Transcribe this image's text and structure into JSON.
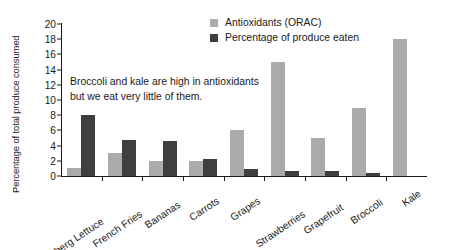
{
  "chart_data": {
    "type": "bar",
    "title": "",
    "xlabel": "",
    "ylabel": "Percentage of total produce consumed",
    "ylim": [
      0,
      20
    ],
    "yticks": [
      0,
      2,
      4,
      6,
      8,
      10,
      12,
      14,
      16,
      18,
      20
    ],
    "grid": false,
    "legend_position": "top-right",
    "categories": [
      "Iceberg Lettuce",
      "French Fries",
      "Bananas",
      "Carrots",
      "Grapes",
      "Strawberries",
      "Grapefruit",
      "Broccoli",
      "Kale"
    ],
    "series": [
      {
        "name": "Antioxidants (ORAC)",
        "color": "#ababab",
        "values": [
          1,
          3,
          2,
          2,
          6,
          15,
          5,
          9,
          18
        ]
      },
      {
        "name": "Percentage of produce eaten",
        "color": "#3f3f3f",
        "values": [
          8,
          4.7,
          4.6,
          2.3,
          0.9,
          0.7,
          0.6,
          0.35,
          0
        ]
      }
    ],
    "annotations": [
      {
        "line1": "Broccoli and kale are high in antioxidants",
        "line2": "but we eat very little of them."
      }
    ]
  },
  "legend": {
    "items": [
      {
        "label": "Antioxidants (ORAC)"
      },
      {
        "label": "Percentage of produce eaten"
      }
    ]
  },
  "annotation": {
    "line1": "Broccoli and kale are high in antioxidants",
    "line2": "but we eat very little of them."
  },
  "axes": {
    "y_title": "Percentage of total produce consumed"
  }
}
